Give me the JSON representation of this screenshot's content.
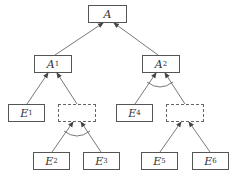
{
  "diagram": {
    "type": "and-or-tree",
    "nodes": [
      {
        "id": "A",
        "label": "A",
        "sub": "",
        "x": 88,
        "y": 5,
        "w": 39,
        "h": 18,
        "style": "solid"
      },
      {
        "id": "A1",
        "label": "A",
        "sub": "1",
        "x": 34,
        "y": 55,
        "w": 38,
        "h": 18,
        "style": "solid"
      },
      {
        "id": "A2",
        "label": "A",
        "sub": "2",
        "x": 142,
        "y": 55,
        "w": 38,
        "h": 18,
        "style": "solid"
      },
      {
        "id": "E1",
        "label": "E",
        "sub": "1",
        "x": 8,
        "y": 104,
        "w": 37,
        "h": 18,
        "style": "solid"
      },
      {
        "id": "D1",
        "label": "",
        "sub": "",
        "x": 58,
        "y": 104,
        "w": 38,
        "h": 18,
        "style": "dashed"
      },
      {
        "id": "E4",
        "label": "E",
        "sub": "4",
        "x": 116,
        "y": 104,
        "w": 37,
        "h": 18,
        "style": "solid"
      },
      {
        "id": "D2",
        "label": "",
        "sub": "",
        "x": 166,
        "y": 104,
        "w": 38,
        "h": 18,
        "style": "dashed"
      },
      {
        "id": "E2",
        "label": "E",
        "sub": "2",
        "x": 33,
        "y": 152,
        "w": 37,
        "h": 18,
        "style": "solid"
      },
      {
        "id": "E3",
        "label": "E",
        "sub": "3",
        "x": 83,
        "y": 152,
        "w": 37,
        "h": 18,
        "style": "solid"
      },
      {
        "id": "E5",
        "label": "E",
        "sub": "5",
        "x": 141,
        "y": 152,
        "w": 37,
        "h": 18,
        "style": "solid"
      },
      {
        "id": "E6",
        "label": "E",
        "sub": "6",
        "x": 192,
        "y": 152,
        "w": 37,
        "h": 18,
        "style": "solid"
      }
    ],
    "edges": [
      {
        "from": "A1",
        "to": "A",
        "gate": "or"
      },
      {
        "from": "A2",
        "to": "A",
        "gate": "or"
      },
      {
        "from": "E1",
        "to": "A1",
        "gate": "or"
      },
      {
        "from": "D1",
        "to": "A1",
        "gate": "or"
      },
      {
        "from": "E4",
        "to": "A2",
        "gate": "and"
      },
      {
        "from": "D2",
        "to": "A2",
        "gate": "and"
      },
      {
        "from": "E2",
        "to": "D1",
        "gate": "and"
      },
      {
        "from": "E3",
        "to": "D1",
        "gate": "and"
      },
      {
        "from": "E5",
        "to": "D2",
        "gate": "or"
      },
      {
        "from": "E6",
        "to": "D2",
        "gate": "or"
      }
    ],
    "colors": {
      "line": "#555555",
      "box": "#555555"
    }
  },
  "labels": {
    "A": "A",
    "A1": "A",
    "A1_sub": "1",
    "A2": "A",
    "A2_sub": "2",
    "E1": "E",
    "E1_sub": "1",
    "E2": "E",
    "E2_sub": "2",
    "E3": "E",
    "E3_sub": "3",
    "E4": "E",
    "E4_sub": "4",
    "E5": "E",
    "E5_sub": "5",
    "E6": "E",
    "E6_sub": "6"
  }
}
